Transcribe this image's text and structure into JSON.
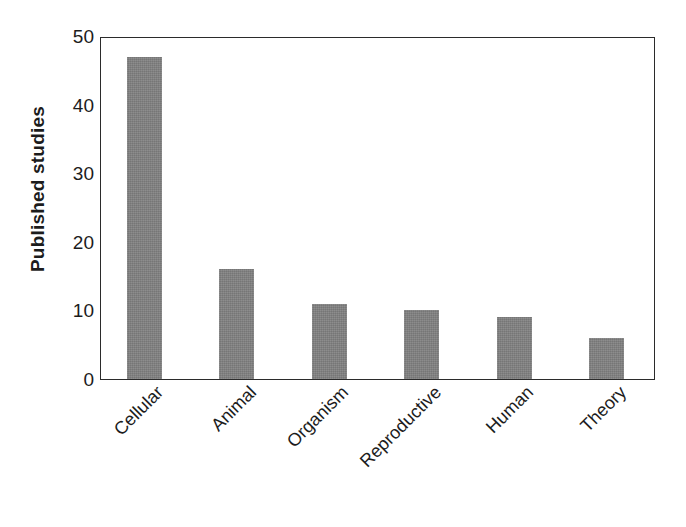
{
  "chart_data": {
    "type": "bar",
    "title": "",
    "xlabel": "",
    "ylabel": "Published studies",
    "categories": [
      "Cellular",
      "Animal",
      "Organism",
      "Reproductive",
      "Human",
      "Theory"
    ],
    "values": [
      47,
      16,
      11,
      10,
      9,
      6
    ],
    "ylim": [
      0,
      50
    ],
    "yticks": [
      0,
      10,
      20,
      30,
      40,
      50
    ],
    "ytick_labels": [
      "0",
      "10",
      "20",
      "30",
      "40",
      "50"
    ],
    "grid": false,
    "legend": false,
    "bar_color": "#808080",
    "axis_color": "#2b2b2b",
    "background": "#ffffff",
    "xtick_rotation": -45,
    "series": [
      {
        "name": "Published studies",
        "values": [
          47,
          16,
          11,
          10,
          9,
          6
        ]
      }
    ]
  }
}
